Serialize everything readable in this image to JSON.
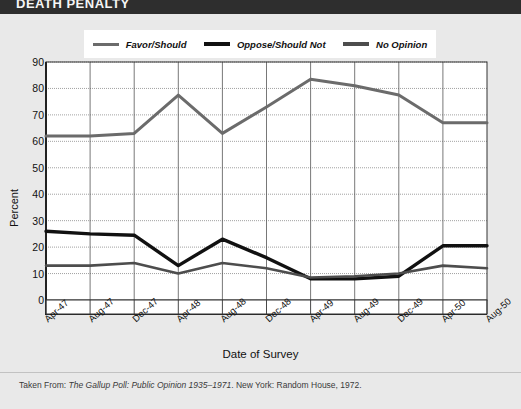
{
  "banner": {
    "title": "DEATH PENALTY"
  },
  "legend": [
    {
      "key": "favor",
      "label": "Favor/Should",
      "color": "#6b6b6b",
      "width": 3
    },
    {
      "key": "oppose",
      "label": "Oppose/Should Not",
      "color": "#111111",
      "width": 4
    },
    {
      "key": "noop",
      "label": "No Opinion",
      "color": "#4d4d4d",
      "width": 4
    }
  ],
  "footer": {
    "prefix": "Taken From: ",
    "italic": "The Gallup Poll: Public Opinion 1935–1971",
    "suffix": ". New York: Random House, 1972."
  },
  "chart_data": {
    "type": "line",
    "title": "",
    "xlabel": "Date of Survey",
    "ylabel": "Percent",
    "ylim": [
      0,
      90
    ],
    "yticks": [
      0,
      10,
      20,
      30,
      40,
      50,
      60,
      70,
      80,
      90
    ],
    "grid": true,
    "legend_position": "top",
    "categories": [
      "Apr-47",
      "Aug-47",
      "Dec-47",
      "Apr-48",
      "Aug-48",
      "Dec-48",
      "Apr-49",
      "Aug-49",
      "Dec-49",
      "Apr-50",
      "Aug-50"
    ],
    "series": [
      {
        "name": "Favor/Should",
        "color": "#6b6b6b",
        "width": 3,
        "values": [
          62,
          62,
          63,
          77.5,
          63,
          73,
          83.5,
          81,
          77.5,
          67,
          67
        ]
      },
      {
        "name": "Oppose/Should Not",
        "color": "#111111",
        "width": 3.4,
        "values": [
          26,
          25,
          24.5,
          13,
          23,
          16,
          8,
          8,
          9,
          20.5,
          20.5
        ]
      },
      {
        "name": "No Opinion",
        "color": "#4d4d4d",
        "width": 2.6,
        "values": [
          13,
          13,
          14,
          10,
          14,
          12,
          8.5,
          9,
          10,
          13,
          12
        ]
      }
    ]
  }
}
